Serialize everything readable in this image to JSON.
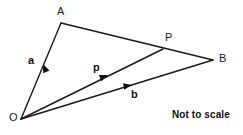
{
  "diagram": {
    "background_color": "#ffffff",
    "stroke_color": "#1a1a1a",
    "points": [
      {
        "id": "O",
        "label": "O",
        "x": 21,
        "y": 119,
        "label_x": 9,
        "label_y": 112
      },
      {
        "id": "A",
        "label": "A",
        "x": 61,
        "y": 23,
        "label_x": 57,
        "label_y": 6
      },
      {
        "id": "B",
        "label": "B",
        "x": 213,
        "y": 60,
        "label_x": 219,
        "label_y": 53
      },
      {
        "id": "P",
        "label": "P",
        "x": 163,
        "y": 49,
        "label_x": 165,
        "label_y": 32
      }
    ],
    "segments": [
      {
        "id": "OA",
        "from": "O",
        "to": "A"
      },
      {
        "id": "AB",
        "from": "A",
        "to": "B"
      },
      {
        "id": "OB",
        "from": "O",
        "to": "B"
      },
      {
        "id": "OP",
        "from": "O",
        "to": "P"
      }
    ],
    "vectors": [
      {
        "id": "a",
        "label": "a",
        "on_segment": "OA",
        "arrow_x": 43,
        "arrow_y": 64,
        "angle_deg": 247,
        "label_x": 28,
        "label_y": 55
      },
      {
        "id": "p",
        "label": "p",
        "on_segment": "OP",
        "arrow_x": 108,
        "arrow_y": 75,
        "angle_deg": 338,
        "label_x": 93,
        "label_y": 62
      },
      {
        "id": "b",
        "label": "b",
        "on_segment": "OB",
        "arrow_x": 132,
        "arrow_y": 85,
        "angle_deg": 350,
        "label_x": 131,
        "label_y": 89
      }
    ],
    "annotation": {
      "text": "Not to scale",
      "x": 172,
      "y": 110
    }
  }
}
